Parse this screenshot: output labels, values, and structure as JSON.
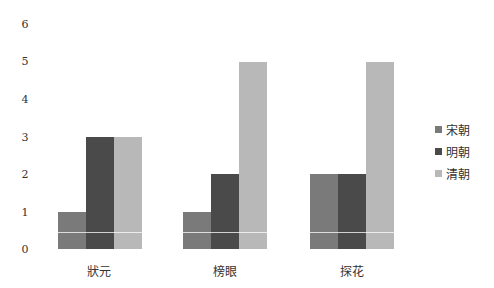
{
  "chart_data": {
    "type": "bar",
    "title": "",
    "xlabel": "",
    "ylabel": "",
    "categories": [
      "狀元",
      "榜眼",
      "探花"
    ],
    "series": [
      {
        "name": "宋朝",
        "color": "#7a7a7a",
        "values": [
          1,
          1,
          2
        ]
      },
      {
        "name": "明朝",
        "color": "#4a4a4a",
        "values": [
          3,
          2,
          2
        ]
      },
      {
        "name": "清朝",
        "color": "#b8b8b8",
        "values": [
          3,
          5,
          5
        ]
      }
    ],
    "ylim": [
      0,
      6
    ],
    "yticks": [
      "0",
      "1",
      "2",
      "3",
      "4",
      "5",
      "6"
    ],
    "grid": false,
    "legend_position": "right"
  }
}
